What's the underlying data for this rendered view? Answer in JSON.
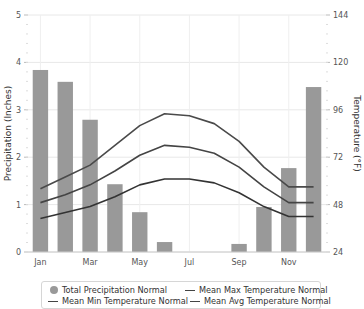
{
  "chart_data": {
    "type": "bar+line",
    "title": "",
    "categories": [
      "Jan",
      "Feb",
      "Mar",
      "Apr",
      "May",
      "Jun",
      "Jul",
      "Aug",
      "Sep",
      "Oct",
      "Nov",
      "Dec"
    ],
    "x_tick_labels": [
      "Jan",
      "Mar",
      "May",
      "Jul",
      "Sep",
      "Nov"
    ],
    "y_left": {
      "label": "Precipitation (Inches)",
      "range": [
        0,
        5
      ],
      "ticks": [
        "0",
        "1",
        "2",
        "3",
        "4",
        "5"
      ]
    },
    "y_right": {
      "label": "Temperature (°F)",
      "range": [
        24,
        144
      ],
      "ticks": [
        "24",
        "48",
        "72",
        "96",
        "120",
        "144"
      ]
    },
    "series": [
      {
        "name": "Total Precipitation Normal",
        "type": "bar",
        "axis": "left",
        "color": "#999999",
        "values": [
          3.84,
          3.59,
          2.79,
          1.43,
          0.84,
          0.21,
          0.0,
          0.0,
          0.17,
          0.95,
          1.77,
          3.48
        ]
      },
      {
        "name": "Mean Max Temperature Normal",
        "type": "line",
        "axis": "right",
        "color": "#4a4a4a",
        "values": [
          56,
          62,
          68,
          78,
          88,
          94,
          93,
          89,
          80,
          67,
          57,
          57
        ]
      },
      {
        "name": "Mean Min Temperature Normal",
        "type": "line",
        "axis": "right",
        "color": "#333333",
        "values": [
          41,
          44,
          47,
          52,
          58,
          61,
          61,
          59,
          54,
          47,
          42,
          42
        ]
      },
      {
        "name": "Mean Avg Temperature Normal",
        "type": "line",
        "axis": "right",
        "color": "#444444",
        "values": [
          49,
          53,
          58,
          65,
          73,
          78,
          77,
          74,
          67,
          57,
          49,
          49
        ]
      }
    ],
    "grid": true,
    "legend_position": "bottom"
  },
  "legend": {
    "items": [
      {
        "label": "Total Precipitation Normal",
        "swatch": "circle"
      },
      {
        "label": "Mean Max Temperature Normal",
        "swatch": "line"
      },
      {
        "label": "Mean Min Temperature Normal",
        "swatch": "line"
      },
      {
        "label": "Mean Avg Temperature Normal",
        "swatch": "line"
      }
    ]
  }
}
